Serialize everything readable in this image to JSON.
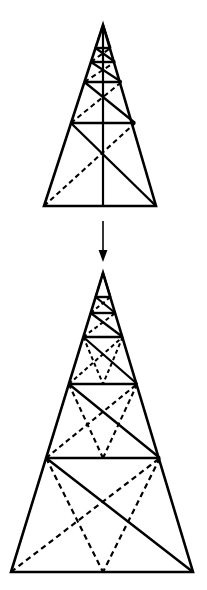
{
  "figure": {
    "background_color": "#ffffff",
    "stroke_color": "#000000",
    "canvas": {
      "width": 207,
      "height": 590
    },
    "arrow": {
      "name": "downward-transform-arrow",
      "direction": "down",
      "x": 103,
      "y_start": 221,
      "y_end": 262,
      "head_width": 9,
      "head_length": 11,
      "shaft_width": 1.6
    },
    "top_shape": {
      "name": "upper-truss-triangle",
      "apex": {
        "x": 103,
        "y": 25
      },
      "base_left": {
        "x": 44,
        "y": 206
      },
      "base_right": {
        "x": 156,
        "y": 206
      },
      "outline_width": 2.6,
      "rung_width": 2.4,
      "diagonal_width": 2.4,
      "dash_pattern": "5,3.5",
      "has_center_vertical": true,
      "center_vertical_width": 2.2,
      "rungs_y": [
        48,
        62,
        82,
        123
      ],
      "levels": [
        {
          "index": 0,
          "y_top": 25,
          "y_bottom": 48,
          "solid_diagonal": "tl-br",
          "dashed_diagonal": "bl-tr"
        },
        {
          "index": 1,
          "y_top": 48,
          "y_bottom": 62,
          "solid_diagonal": "tl-br",
          "dashed_diagonal": "bl-tr"
        },
        {
          "index": 2,
          "y_top": 62,
          "y_bottom": 82,
          "solid_diagonal": "tl-br",
          "dashed_diagonal": "bl-tr"
        },
        {
          "index": 3,
          "y_top": 82,
          "y_bottom": 123,
          "solid_diagonal": "tl-br",
          "dashed_diagonal": "bl-tr"
        },
        {
          "index": 4,
          "y_top": 123,
          "y_bottom": 206,
          "solid_diagonal": "tl-br",
          "dashed_diagonal": "bl-tr"
        }
      ]
    },
    "bottom_shape": {
      "name": "lower-truss-triangle",
      "apex": {
        "x": 103,
        "y": 273
      },
      "base_left": {
        "x": 11,
        "y": 572
      },
      "base_right": {
        "x": 193,
        "y": 572
      },
      "outline_width": 2.6,
      "rung_width": 2.4,
      "diagonal_width": 2.4,
      "dash_pattern": "5,3.5",
      "has_center_vertical": false,
      "rungs_y": [
        297,
        313,
        337,
        384,
        458
      ],
      "levels": [
        {
          "index": 0,
          "y_top": 273,
          "y_bottom": 297,
          "solid_diagonal": "tl-br",
          "dashed_diagonal": "bl-tr"
        },
        {
          "index": 1,
          "y_top": 297,
          "y_bottom": 313,
          "solid_diagonal": "tl-br",
          "dashed_diagonal": "bl-tr"
        },
        {
          "index": 2,
          "y_top": 313,
          "y_bottom": 337,
          "solid_diagonal": "tl-br",
          "dashed_diagonal": "bl-tr"
        },
        {
          "index": 3,
          "y_top": 337,
          "y_bottom": 384,
          "solid_diagonal": "tl-br",
          "dashed_diagonal": "bl-tr"
        },
        {
          "index": 4,
          "y_top": 384,
          "y_bottom": 458,
          "solid_diagonal": "tl-br",
          "dashed_diagonal": "bl-tr"
        },
        {
          "index": 5,
          "y_top": 458,
          "y_bottom": 572,
          "solid_diagonal": "tl-br",
          "dashed_diagonal": "bl-tr"
        }
      ],
      "converging_dashed_fans": [
        {
          "name": "fan-level-3",
          "apex_x": 103,
          "apex_y": 384
        },
        {
          "name": "fan-level-4",
          "apex_x": 103,
          "apex_y": 458
        },
        {
          "name": "fan-level-5",
          "apex_x": 103,
          "apex_y": 522
        }
      ]
    }
  }
}
